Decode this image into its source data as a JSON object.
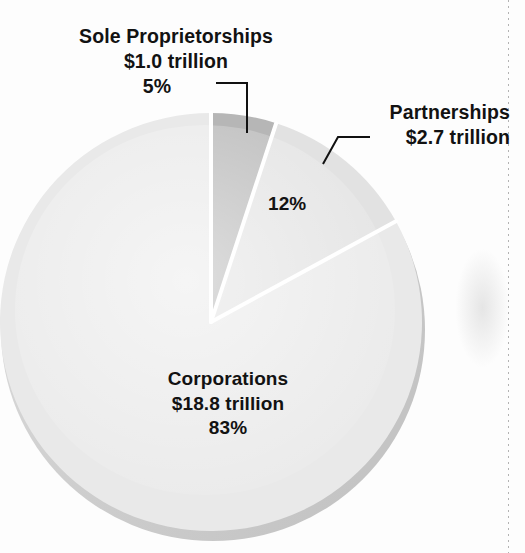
{
  "chart_data": {
    "type": "pie",
    "title": "",
    "subtitle": "",
    "xlabel": "",
    "ylabel": "",
    "legend_position": "none",
    "grid": false,
    "units": "trillions of dollars",
    "categories": [
      "Sole Proprietorships",
      "Partnerships",
      "Corporations"
    ],
    "values": [
      1.0,
      2.7,
      18.8
    ],
    "percentages": [
      5,
      12,
      83
    ],
    "value_labels": [
      "$1.0 trillion",
      "$2.7 trillion",
      "$18.8 trillion"
    ],
    "percent_labels": [
      "5%",
      "12%",
      "83%"
    ],
    "start_angle_deg": 0,
    "direction": "clockwise",
    "slice_colors": [
      "#b6b6b6",
      "#e2e2e2",
      "#e9e9e9"
    ],
    "slices": [
      {
        "name": "Sole Proprietorships",
        "value": 1.0,
        "percent": 5,
        "value_label": "$1.0 trillion",
        "percent_label": "5%",
        "color": "#b6b6b6",
        "start_deg": 0,
        "end_deg": 18
      },
      {
        "name": "Partnerships",
        "value": 2.7,
        "percent": 12,
        "value_label": "$2.7 trillion",
        "percent_label": "12%",
        "color": "#e2e2e2",
        "start_deg": 18,
        "end_deg": 61.2
      },
      {
        "name": "Corporations",
        "value": 18.8,
        "percent": 83,
        "value_label": "$18.8 trillion",
        "percent_label": "83%",
        "color": "#e9e9e9",
        "start_deg": 61.2,
        "end_deg": 360
      }
    ]
  },
  "labels": {
    "sole": {
      "name": "Sole Proprietorships",
      "value": "$1.0 trillion",
      "percent": "5%"
    },
    "partnerships": {
      "name": "Partnerships",
      "value": "$2.7 trillion",
      "percent": "12%"
    },
    "corporations": {
      "name": "Corporations",
      "value": "$18.8 trillion",
      "percent": "83%"
    }
  },
  "colors": {
    "sole_slice": "#b6b6b6",
    "partnerships_slice": "#e2e2e2",
    "corporations_slice": "#e9e9e9",
    "slice_divider": "#ffffff",
    "pie_rim_shadow": "#cfcfcf",
    "text": "#121212",
    "page_background": "#fdfdfd"
  }
}
